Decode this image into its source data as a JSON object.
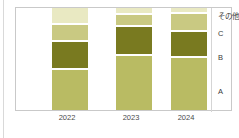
{
  "chart_data": {
    "type": "bar",
    "variant": "stacked-column-100pct",
    "title": "",
    "subtitle": "",
    "xlabel": "",
    "ylabel": "",
    "grid": false,
    "legend_position": "right-inside",
    "categories": [
      "2022",
      "2023",
      "2024"
    ],
    "series": [
      {
        "name": "A",
        "values": [
          40,
          52,
          46
        ],
        "color": "#b9bb63"
      },
      {
        "name": "B",
        "values": [
          28,
          27,
          23
        ],
        "color": "#797a20"
      },
      {
        "name": "C",
        "values": [
          16,
          11,
          16
        ],
        "color": "#c9c982"
      },
      {
        "name": "その他",
        "values": [
          16,
          6,
          4
        ],
        "color": "#e9e9c2"
      }
    ],
    "ylim": [
      0,
      100
    ],
    "stack_order_top_to_bottom": [
      "その他",
      "C",
      "B",
      "A"
    ],
    "annotations": []
  },
  "labels": {
    "other": "その他",
    "c": "C",
    "b": "B",
    "a": "A"
  },
  "axis": {
    "x_ticks": [
      "2022",
      "2023",
      "2024"
    ]
  },
  "colors": {
    "a": "#b9bb63",
    "b": "#797a20",
    "c": "#c9c982",
    "other": "#e9e9c2",
    "frame_border": "#c9c9c9",
    "background": "#ffffff",
    "text": "#3a3a3a"
  }
}
